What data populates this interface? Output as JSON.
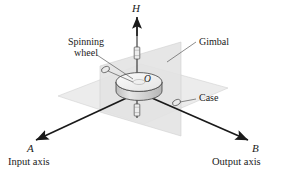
{
  "figure": {
    "type": "engineering-line-diagram",
    "background_color": "#ffffff"
  },
  "axes": {
    "vertical": {
      "letter": "H",
      "name": "",
      "direction": "up",
      "arrow": true
    },
    "left": {
      "letter": "A",
      "name": "Input axis",
      "direction": "down-left",
      "arrow": true
    },
    "right": {
      "letter": "B",
      "name": "Output axis",
      "direction": "down-right",
      "arrow": true
    }
  },
  "origin": {
    "label": "O"
  },
  "parts": [
    {
      "key": "spinning_wheel",
      "label_line1": "Spinning",
      "label_line2": "wheel"
    },
    {
      "key": "gimbal",
      "label": "Gimbal"
    },
    {
      "key": "case",
      "label": "Case"
    }
  ],
  "labels": {
    "spinning_wheel_line1": "Spinning",
    "spinning_wheel_line2": "wheel",
    "gimbal": "Gimbal",
    "case": "Case",
    "origin": "O",
    "h": "H",
    "a": "A",
    "b": "B",
    "input_axis": "Input axis",
    "output_axis": "Output axis"
  },
  "colors": {
    "line": "#1a1a1a",
    "text": "#1a1a1a",
    "case_plane_fill": "#ececec",
    "gimbal_plane_fill": "#e2e2e2",
    "disk_top_fill": "#f2f2f2",
    "disk_side_fill": "#d8d8d8",
    "bearing_fill": "#e8e8e8",
    "leader_line": "#5a5a5a"
  }
}
